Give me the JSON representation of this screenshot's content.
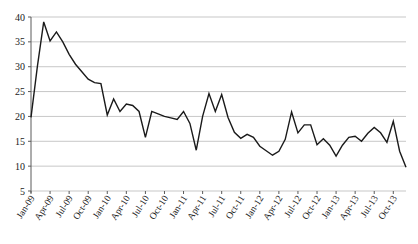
{
  "chart_data": {
    "type": "line",
    "title": "",
    "xlabel": "",
    "ylabel": "",
    "ylim": [
      5,
      40
    ],
    "ytick_values": [
      5,
      10,
      15,
      20,
      25,
      30,
      35,
      40
    ],
    "grid": true,
    "legend": "none",
    "x_tick_labels": [
      "Jan-09",
      "Apr-09",
      "Jul-09",
      "Oct-09",
      "Jan-10",
      "Apr-10",
      "Jul-10",
      "Oct-10",
      "Jan-11",
      "Apr-11",
      "Jul-11",
      "Oct-11",
      "Jan-12",
      "Apr-12",
      "Jul-12",
      "Oct-12",
      "Jan-13",
      "Apr-13",
      "Jul-13",
      "Oct-13"
    ],
    "x_tick_indices": [
      0,
      3,
      6,
      9,
      12,
      15,
      18,
      21,
      24,
      27,
      30,
      33,
      36,
      39,
      42,
      45,
      48,
      51,
      54,
      57
    ],
    "x": [
      "Jan-09",
      "Feb-09",
      "Mar-09",
      "Apr-09",
      "May-09",
      "Jun-09",
      "Jul-09",
      "Aug-09",
      "Sep-09",
      "Oct-09",
      "Nov-09",
      "Dec-09",
      "Jan-10",
      "Feb-10",
      "Mar-10",
      "Apr-10",
      "May-10",
      "Jun-10",
      "Jul-10",
      "Aug-10",
      "Sep-10",
      "Oct-10",
      "Nov-10",
      "Dec-10",
      "Jan-11",
      "Feb-11",
      "Mar-11",
      "Apr-11",
      "May-11",
      "Jun-11",
      "Jul-11",
      "Aug-11",
      "Sep-11",
      "Oct-11",
      "Nov-11",
      "Dec-11",
      "Jan-12",
      "Feb-12",
      "Mar-12",
      "Apr-12",
      "May-12",
      "Jun-12",
      "Jul-12",
      "Aug-12",
      "Sep-12",
      "Oct-12",
      "Nov-12",
      "Dec-12",
      "Jan-13",
      "Feb-13",
      "Mar-13",
      "Apr-13",
      "May-13",
      "Jun-13",
      "Jul-13",
      "Aug-13",
      "Sep-13",
      "Oct-13",
      "Nov-13",
      "Dec-13"
    ],
    "values": [
      19.8,
      30.0,
      39.0,
      35.2,
      37.0,
      35.0,
      32.5,
      30.5,
      29.0,
      27.5,
      26.8,
      26.6,
      20.3,
      23.5,
      21.0,
      22.5,
      22.2,
      21.0,
      15.8,
      21.0,
      20.5,
      20.0,
      19.7,
      19.4,
      21.0,
      18.6,
      13.2,
      20.0,
      24.6,
      21.0,
      24.4,
      19.8,
      16.8,
      15.6,
      16.4,
      15.8,
      14.0,
      13.1,
      12.2,
      13.0,
      15.4,
      20.9,
      16.7,
      18.3,
      18.3,
      14.3,
      15.5,
      14.2,
      12.0,
      14.2,
      15.8,
      16.0,
      15.0,
      16.6,
      17.8,
      16.7,
      14.8,
      19.0,
      13.0,
      9.8
    ],
    "series_name": "series-1",
    "line_color": "#1a1a1a",
    "grid_color": "#b9b9b9",
    "axis_color": "#5a5a5a"
  }
}
